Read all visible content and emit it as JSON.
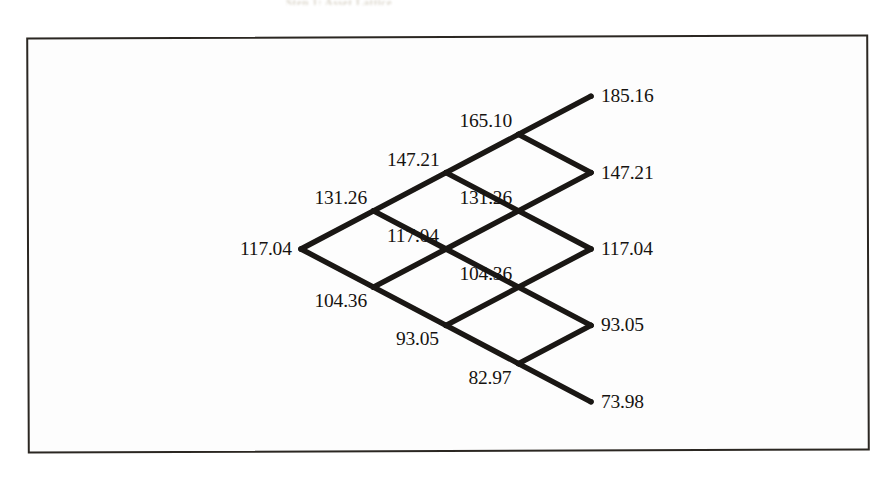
{
  "figure": {
    "kind": "binomial-lattice",
    "caption_remnant": "Step 1: Asset Lattice",
    "frame": {
      "border_color": "#2b2722",
      "background": "#fdfdfd"
    },
    "line_color": "#1a1714",
    "text_color": "#161310"
  },
  "chart_data": {
    "type": "diagram",
    "subtype": "binomial-lattice",
    "title": "",
    "steps": 4,
    "root_value": 117.04,
    "up_factor": 1.1215,
    "down_factor": 0.8917,
    "grid": {
      "origin_x": 301,
      "origin_y": 249,
      "dx": 72.5,
      "dy": 38.2
    },
    "columns": [
      {
        "step": 0,
        "values": [
          "117.04"
        ]
      },
      {
        "step": 1,
        "values": [
          "131.26",
          "104.36"
        ]
      },
      {
        "step": 2,
        "values": [
          "147.21",
          "117.04",
          "93.05"
        ]
      },
      {
        "step": 3,
        "values": [
          "165.10",
          "131.26",
          "104.36",
          "82.97"
        ]
      },
      {
        "step": 4,
        "values": [
          "185.16",
          "147.21",
          "117.04",
          "93.05",
          "73.98"
        ]
      }
    ],
    "nodes": [
      {
        "id": "n0-0",
        "step": 0,
        "level": 0,
        "value": "117.04",
        "label_pos": "left"
      },
      {
        "id": "n1-0",
        "step": 1,
        "level": 1,
        "value": "131.26",
        "label_pos": "above-left"
      },
      {
        "id": "n1-1",
        "step": 1,
        "level": -1,
        "value": "104.36",
        "label_pos": "below-left"
      },
      {
        "id": "n2-0",
        "step": 2,
        "level": 2,
        "value": "147.21",
        "label_pos": "above-left"
      },
      {
        "id": "n2-1",
        "step": 2,
        "level": 0,
        "value": "117.04",
        "label_pos": "above-left"
      },
      {
        "id": "n2-2",
        "step": 2,
        "level": -2,
        "value": "93.05",
        "label_pos": "below-left"
      },
      {
        "id": "n3-0",
        "step": 3,
        "level": 3,
        "value": "165.10",
        "label_pos": "above-left"
      },
      {
        "id": "n3-1",
        "step": 3,
        "level": 1,
        "value": "131.26",
        "label_pos": "above-left"
      },
      {
        "id": "n3-2",
        "step": 3,
        "level": -1,
        "value": "104.36",
        "label_pos": "above-left"
      },
      {
        "id": "n3-3",
        "step": 3,
        "level": -3,
        "value": "82.97",
        "label_pos": "below-left"
      },
      {
        "id": "n4-0",
        "step": 4,
        "level": 4,
        "value": "185.16",
        "label_pos": "right"
      },
      {
        "id": "n4-1",
        "step": 4,
        "level": 2,
        "value": "147.21",
        "label_pos": "right"
      },
      {
        "id": "n4-2",
        "step": 4,
        "level": 0,
        "value": "117.04",
        "label_pos": "right"
      },
      {
        "id": "n4-3",
        "step": 4,
        "level": -2,
        "value": "93.05",
        "label_pos": "right"
      },
      {
        "id": "n4-4",
        "step": 4,
        "level": -4,
        "value": "73.98",
        "label_pos": "right"
      }
    ],
    "edges": [
      [
        "n0-0",
        "n1-0"
      ],
      [
        "n0-0",
        "n1-1"
      ],
      [
        "n1-0",
        "n2-0"
      ],
      [
        "n1-0",
        "n2-1"
      ],
      [
        "n1-1",
        "n2-1"
      ],
      [
        "n1-1",
        "n2-2"
      ],
      [
        "n2-0",
        "n3-0"
      ],
      [
        "n2-0",
        "n3-1"
      ],
      [
        "n2-1",
        "n3-1"
      ],
      [
        "n2-1",
        "n3-2"
      ],
      [
        "n2-2",
        "n3-2"
      ],
      [
        "n2-2",
        "n3-3"
      ],
      [
        "n3-0",
        "n4-0"
      ],
      [
        "n3-0",
        "n4-1"
      ],
      [
        "n3-1",
        "n4-1"
      ],
      [
        "n3-1",
        "n4-2"
      ],
      [
        "n3-2",
        "n4-2"
      ],
      [
        "n3-2",
        "n4-3"
      ],
      [
        "n3-3",
        "n4-3"
      ],
      [
        "n3-3",
        "n4-4"
      ]
    ]
  }
}
